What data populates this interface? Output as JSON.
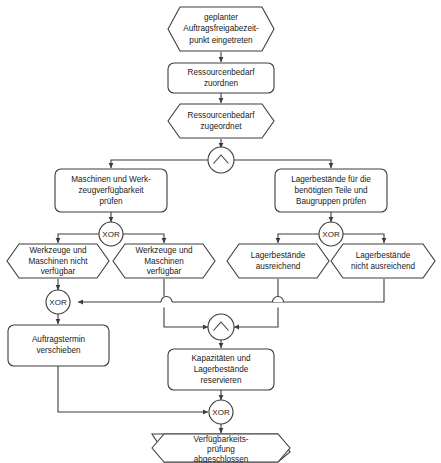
{
  "diagram": {
    "type": "event-driven-process-chain",
    "colors": {
      "stroke": "#3c3c3c",
      "fill": "#ffffff",
      "text": "#1a1a1a",
      "background": "#ffffff"
    },
    "nodes": {
      "start_event": {
        "kind": "event",
        "lines": [
          "geplanter",
          "Auftragsfreigabezeit-",
          "punkt eingetreten"
        ]
      },
      "function_assign": {
        "kind": "function",
        "lines": [
          "Ressourcenbedarf",
          "zuordnen"
        ]
      },
      "event_assigned": {
        "kind": "event",
        "lines": [
          "Ressourcenbedarf",
          "zugeordnet"
        ]
      },
      "and_split": {
        "kind": "connector",
        "label": "∧",
        "operator": "AND"
      },
      "function_check_machines": {
        "kind": "function",
        "lines": [
          "Maschinen und Werk-",
          "zeugverfügbarkeit",
          "prüfen"
        ]
      },
      "function_check_stock": {
        "kind": "function",
        "lines": [
          "Lagerbestände für die",
          "benötigten Teile und",
          "Baugruppen prüfen"
        ]
      },
      "xor_machines": {
        "kind": "connector",
        "label": "XOR",
        "operator": "XOR"
      },
      "xor_stock": {
        "kind": "connector",
        "label": "XOR",
        "operator": "XOR"
      },
      "event_tools_unavailable": {
        "kind": "event",
        "lines": [
          "Werkzeuge und",
          "Maschinen nicht",
          "verfügbar"
        ]
      },
      "event_tools_available": {
        "kind": "event",
        "lines": [
          "Werkzeuge und",
          "Maschinen",
          "verfügbar"
        ]
      },
      "event_stock_sufficient": {
        "kind": "event",
        "lines": [
          "Lagerbestände",
          "ausreichend"
        ]
      },
      "event_stock_insufficient": {
        "kind": "event",
        "lines": [
          "Lagerbestände",
          "nicht ausreichend"
        ]
      },
      "xor_join_left": {
        "kind": "connector",
        "label": "XOR",
        "operator": "XOR"
      },
      "and_join": {
        "kind": "connector",
        "label": "∧",
        "operator": "AND"
      },
      "function_reschedule": {
        "kind": "function",
        "lines": [
          "Auftragstermin",
          "verschieben"
        ]
      },
      "function_reserve": {
        "kind": "function",
        "lines": [
          "Kapazitäten und",
          "Lagerbestände",
          "reservieren"
        ]
      },
      "xor_final": {
        "kind": "connector",
        "label": "XOR",
        "operator": "XOR"
      },
      "end_event": {
        "kind": "event",
        "lines": [
          "Verfügbarkeits-",
          "prüfung",
          "abgeschlossen"
        ]
      }
    }
  }
}
